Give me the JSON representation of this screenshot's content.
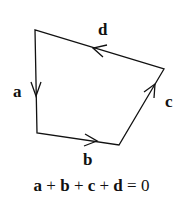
{
  "diagram": {
    "vectors": [
      {
        "label": "a",
        "from": [
          35,
          30
        ],
        "to": [
          37,
          133
        ]
      },
      {
        "label": "b",
        "from": [
          37,
          133
        ],
        "to": [
          119,
          145
        ]
      },
      {
        "label": "c",
        "from": [
          119,
          145
        ],
        "to": [
          164,
          69
        ]
      },
      {
        "label": "d",
        "from": [
          164,
          69
        ],
        "to": [
          35,
          30
        ]
      }
    ],
    "labels": {
      "a": "a",
      "b": "b",
      "c": "c",
      "d": "d"
    },
    "equation": {
      "terms": [
        "a",
        "b",
        "c",
        "d"
      ],
      "plus": "+",
      "equals": "=",
      "rhs": "0"
    },
    "colors": {
      "stroke": "#111111",
      "background": "#ffffff"
    }
  }
}
